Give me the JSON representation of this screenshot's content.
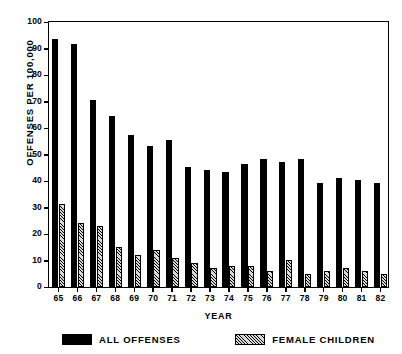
{
  "chart_data": {
    "type": "bar",
    "title": "",
    "xlabel": "YEAR",
    "ylabel": "OFFENSES PER 100,000",
    "ylim": [
      0,
      100
    ],
    "ytick_step": 10,
    "yticks": [
      0,
      10,
      20,
      30,
      40,
      50,
      60,
      70,
      80,
      90,
      100
    ],
    "grid": false,
    "legend_position": "bottom",
    "categories": [
      "65",
      "66",
      "67",
      "68",
      "69",
      "70",
      "71",
      "72",
      "73",
      "74",
      "75",
      "76",
      "77",
      "78",
      "79",
      "80",
      "81",
      "82"
    ],
    "series": [
      {
        "name": "ALL OFFENSES",
        "fill": "solid-black",
        "values": [
          93,
          91,
          70,
          64,
          57,
          53,
          55,
          45,
          44,
          43,
          46,
          48,
          47,
          48,
          39,
          41,
          40,
          39
        ]
      },
      {
        "name": "FEMALE CHILDREN",
        "fill": "hatched",
        "values": [
          31,
          24,
          23,
          15,
          12,
          14,
          11,
          9,
          7,
          8,
          8,
          6,
          10,
          5,
          6,
          7,
          6,
          5
        ]
      }
    ]
  },
  "colors": {
    "series_all_offenses": "#000000",
    "series_female_children": "#d9d9d9",
    "axis": "#000000",
    "background": "#ffffff"
  },
  "legend": {
    "entries": [
      {
        "label": "ALL OFFENSES",
        "swatch": "solid"
      },
      {
        "label": "FEMALE CHILDREN",
        "swatch": "hatch"
      }
    ]
  }
}
